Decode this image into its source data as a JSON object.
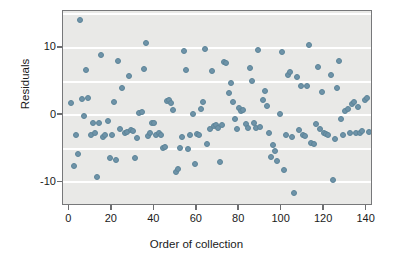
{
  "chart_data": {
    "type": "scatter",
    "title": "",
    "xlabel": "Order of collection",
    "ylabel": "Residuals",
    "xlim": [
      -3,
      143
    ],
    "ylim": [
      -13.5,
      15.5
    ],
    "xticks": [
      0,
      20,
      40,
      60,
      80,
      100,
      120,
      140
    ],
    "yticks": [
      10,
      0,
      -10
    ],
    "xtick_labels": [
      "0",
      "20",
      "40",
      "60",
      "80",
      "100",
      "120",
      "140"
    ],
    "ytick_labels": [
      "10",
      "0",
      "-10"
    ],
    "gridlines": {
      "horizontal": [
        15,
        10,
        5,
        0,
        -5,
        -10
      ],
      "vertical": []
    },
    "legend": null,
    "marker": {
      "color": "#6e93a8",
      "shape": "circle",
      "size": 6
    },
    "plot_background": "#e9e9e7",
    "grid_color": "#ffffff",
    "frame_color": "#77787a",
    "n_points": 141,
    "points": [
      [
        1,
        1.8
      ],
      [
        2,
        -7.6
      ],
      [
        3,
        -3.0
      ],
      [
        4,
        -5.7
      ],
      [
        5,
        14.1
      ],
      [
        6,
        2.4
      ],
      [
        7,
        -0.1
      ],
      [
        8,
        6.8
      ],
      [
        9,
        2.5
      ],
      [
        10,
        -2.9
      ],
      [
        11,
        -1.2
      ],
      [
        12,
        -2.6
      ],
      [
        13,
        -9.2
      ],
      [
        14,
        -1.1
      ],
      [
        15,
        8.9
      ],
      [
        16,
        -3.3
      ],
      [
        17,
        -3.0
      ],
      [
        18,
        -0.9
      ],
      [
        19,
        -6.4
      ],
      [
        20,
        -3.0
      ],
      [
        21,
        1.9
      ],
      [
        22,
        -6.6
      ],
      [
        23,
        8.0
      ],
      [
        24,
        -2.1
      ],
      [
        25,
        4.0
      ],
      [
        26,
        -2.7
      ],
      [
        27,
        -2.5
      ],
      [
        28,
        5.9
      ],
      [
        29,
        -2.2
      ],
      [
        30,
        -2.3
      ],
      [
        31,
        -6.4
      ],
      [
        32,
        -3.4
      ],
      [
        33,
        0.4
      ],
      [
        34,
        0.5
      ],
      [
        35,
        6.9
      ],
      [
        36,
        10.8
      ],
      [
        37,
        -3.1
      ],
      [
        38,
        -2.6
      ],
      [
        39,
        -1.1
      ],
      [
        40,
        -1.2
      ],
      [
        41,
        -3.0
      ],
      [
        42,
        -2.7
      ],
      [
        43,
        -2.9
      ],
      [
        44,
        -4.8
      ],
      [
        45,
        -4.7
      ],
      [
        46,
        2.1
      ],
      [
        47,
        2.3
      ],
      [
        48,
        1.8
      ],
      [
        49,
        0.8
      ],
      [
        50,
        -8.5
      ],
      [
        51,
        -8.0
      ],
      [
        52,
        -4.9
      ],
      [
        53,
        -3.3
      ],
      [
        54,
        9.5
      ],
      [
        55,
        6.7
      ],
      [
        56,
        -5.0
      ],
      [
        57,
        -3.0
      ],
      [
        58,
        0.2
      ],
      [
        59,
        -7.3
      ],
      [
        60,
        -2.8
      ],
      [
        61,
        -2.9
      ],
      [
        62,
        1.0
      ],
      [
        63,
        1.9
      ],
      [
        64,
        9.9
      ],
      [
        65,
        -4.3
      ],
      [
        66,
        -2.0
      ],
      [
        67,
        6.6
      ],
      [
        68,
        -1.6
      ],
      [
        69,
        -1.5
      ],
      [
        70,
        -1.9
      ],
      [
        71,
        -7.0
      ],
      [
        72,
        -1.5
      ],
      [
        73,
        7.9
      ],
      [
        74,
        7.7
      ],
      [
        75,
        3.3
      ],
      [
        76,
        4.8
      ],
      [
        77,
        1.9
      ],
      [
        78,
        -0.6
      ],
      [
        79,
        -2.0
      ],
      [
        80,
        1.1
      ],
      [
        81,
        0.6
      ],
      [
        82,
        0.8
      ],
      [
        83,
        -1.3
      ],
      [
        84,
        -1.9
      ],
      [
        85,
        7.0
      ],
      [
        86,
        5.1
      ],
      [
        87,
        -1.1
      ],
      [
        88,
        -1.9
      ],
      [
        89,
        9.7
      ],
      [
        90,
        -1.8
      ],
      [
        91,
        2.2
      ],
      [
        92,
        3.6
      ],
      [
        93,
        1.3
      ],
      [
        94,
        -2.7
      ],
      [
        95,
        -6.2
      ],
      [
        96,
        -4.4
      ],
      [
        97,
        -5.3
      ],
      [
        98,
        -6.8
      ],
      [
        99,
        0.2
      ],
      [
        100,
        9.4
      ],
      [
        101,
        -8.2
      ],
      [
        102,
        -3.0
      ],
      [
        103,
        6.0
      ],
      [
        104,
        6.4
      ],
      [
        105,
        -3.3
      ],
      [
        106,
        -11.6
      ],
      [
        107,
        5.7
      ],
      [
        108,
        -2.2
      ],
      [
        109,
        4.3
      ],
      [
        110,
        -2.9
      ],
      [
        111,
        -3.1
      ],
      [
        112,
        4.4
      ],
      [
        113,
        10.5
      ],
      [
        114,
        -4.2
      ],
      [
        115,
        -4.3
      ],
      [
        116,
        -1.3
      ],
      [
        117,
        7.2
      ],
      [
        118,
        -2.0
      ],
      [
        119,
        3.4
      ],
      [
        120,
        -2.6
      ],
      [
        121,
        -2.8
      ],
      [
        122,
        -3.0
      ],
      [
        123,
        6.0
      ],
      [
        124,
        -9.7
      ],
      [
        125,
        -3.5
      ],
      [
        126,
        4.0
      ],
      [
        127,
        8.0
      ],
      [
        128,
        -0.5
      ],
      [
        129,
        -3.0
      ],
      [
        130,
        0.7
      ],
      [
        131,
        0.9
      ],
      [
        132,
        -2.6
      ],
      [
        133,
        1.7
      ],
      [
        134,
        1.9
      ],
      [
        135,
        -2.7
      ],
      [
        136,
        1.2
      ],
      [
        137,
        -2.6
      ],
      [
        138,
        -2.4
      ],
      [
        139,
        2.3
      ],
      [
        140,
        2.6
      ],
      [
        141,
        -2.5
      ]
    ]
  }
}
